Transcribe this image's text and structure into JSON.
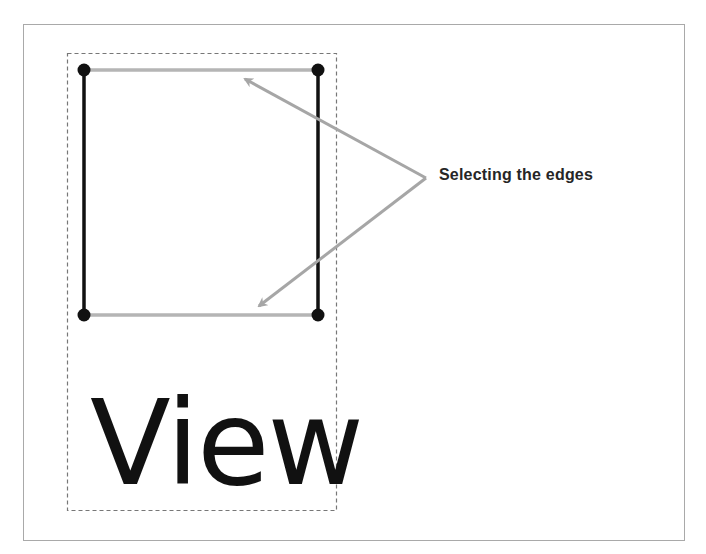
{
  "diagram": {
    "callout_label": "Selecting the edges",
    "view_label": "View",
    "colors": {
      "frame_border": "#a9a9a9",
      "selection_box": "#777777",
      "edge_selected": "#b5b5b5",
      "edge_unselected": "#111111",
      "node": "#111111",
      "arrow": "#a6a6a6",
      "text": "#262626"
    },
    "nodes": [
      {
        "id": "top-left",
        "x": 84,
        "y": 70
      },
      {
        "id": "top-right",
        "x": 318,
        "y": 70
      },
      {
        "id": "bottom-left",
        "x": 84,
        "y": 315
      },
      {
        "id": "bottom-right",
        "x": 318,
        "y": 315
      }
    ],
    "edges": [
      {
        "id": "top-edge",
        "from": "top-left",
        "to": "top-right",
        "selected": true
      },
      {
        "id": "bottom-edge",
        "from": "bottom-left",
        "to": "bottom-right",
        "selected": true
      },
      {
        "id": "left-edge",
        "from": "top-left",
        "to": "bottom-left",
        "selected": false
      },
      {
        "id": "right-edge",
        "from": "top-right",
        "to": "bottom-right",
        "selected": false
      }
    ]
  }
}
